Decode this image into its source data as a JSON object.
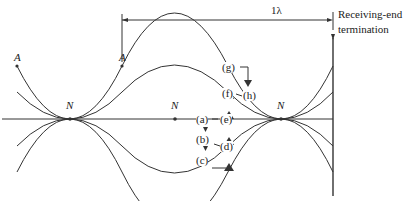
{
  "dimension": {
    "label": "1λ"
  },
  "termination": {
    "label_line1": "Receiving-end",
    "label_line2": "termination"
  },
  "antinodes": [
    "A",
    "A"
  ],
  "nodes": [
    "N",
    "N",
    "N"
  ],
  "phases": {
    "a": "(a)",
    "b": "(b)",
    "c": "(c)",
    "d": "(d)",
    "e": "(e)",
    "f": "(f)",
    "g": "(g)",
    "h": "(h)"
  },
  "colors": {
    "line": "#333333",
    "background": "#ffffff"
  }
}
